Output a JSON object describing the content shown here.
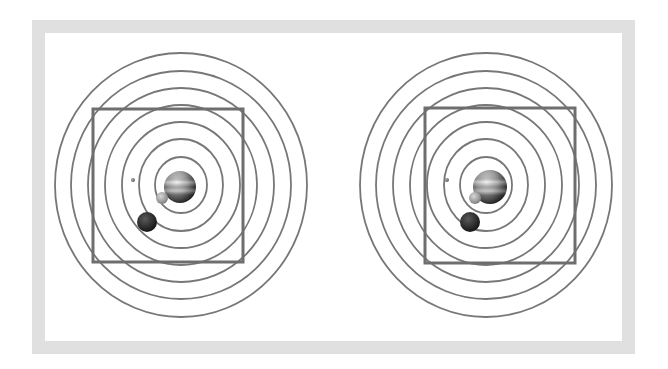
{
  "figure": {
    "frame_color": "#e0e0e0",
    "orbit_color": "#777777",
    "square_color": "#6e6e6e",
    "panels": [
      {
        "id": "left",
        "center": [
          181,
          185
        ],
        "orbits_rx": [
          126,
          110,
          93,
          76,
          59,
          42,
          26
        ],
        "orbits_ry": [
          132,
          114,
          97,
          80,
          63,
          46,
          28
        ],
        "square": {
          "x": 93,
          "y": 109,
          "w": 150,
          "h": 153
        },
        "planet": {
          "cx": 180,
          "cy": 187,
          "r": 16
        },
        "moons": [
          {
            "name": "tiny",
            "cx": 133,
            "cy": 180,
            "r": 2
          },
          {
            "name": "grey",
            "cx": 162,
            "cy": 198,
            "r": 6
          },
          {
            "name": "dark",
            "cx": 147,
            "cy": 222,
            "r": 10
          }
        ]
      },
      {
        "id": "right",
        "center": [
          486,
          185
        ],
        "orbits_rx": [
          126,
          110,
          93,
          76,
          59,
          42,
          26
        ],
        "orbits_ry": [
          132,
          114,
          97,
          80,
          63,
          46,
          28
        ],
        "square": {
          "x": 425,
          "y": 108,
          "w": 150,
          "h": 155
        },
        "planet": {
          "cx": 490,
          "cy": 187,
          "r": 17
        },
        "moons": [
          {
            "name": "tiny",
            "cx": 447,
            "cy": 180,
            "r": 2
          },
          {
            "name": "grey",
            "cx": 475,
            "cy": 198,
            "r": 6
          },
          {
            "name": "dark",
            "cx": 470,
            "cy": 222,
            "r": 10
          }
        ]
      }
    ]
  }
}
